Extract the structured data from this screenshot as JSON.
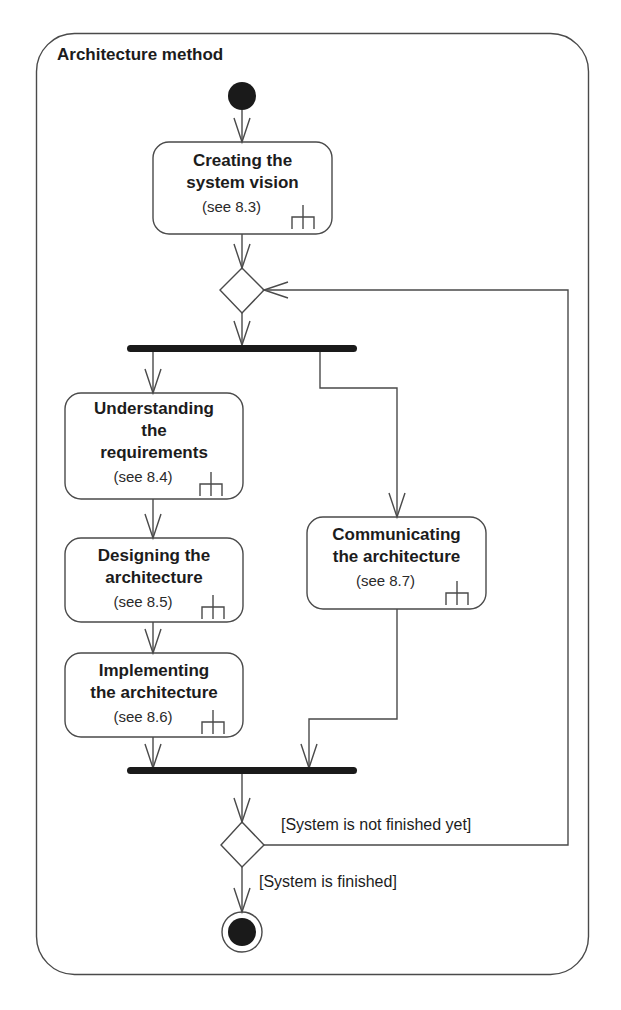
{
  "diagram": {
    "title": "Architecture method",
    "type": "UML activity diagram",
    "colors": {
      "stroke": "#4a4a4a",
      "fill_dark": "#1a1a1a",
      "text": "#1c1c1c",
      "background": "#ffffff"
    },
    "actions": [
      {
        "id": "a1",
        "name": "Creating the system vision",
        "lines": [
          "Creating the",
          "system vision"
        ],
        "ref": "(see 8.3)",
        "icon": "rake-icon"
      },
      {
        "id": "a2",
        "name": "Understanding the requirements",
        "lines": [
          "Understanding",
          "the",
          "requirements"
        ],
        "ref": "(see 8.4)",
        "icon": "rake-icon"
      },
      {
        "id": "a3",
        "name": "Designing the architecture",
        "lines": [
          "Designing the",
          "architecture"
        ],
        "ref": "(see 8.5)",
        "icon": "rake-icon"
      },
      {
        "id": "a4",
        "name": "Implementing the architecture",
        "lines": [
          "Implementing",
          "the architecture"
        ],
        "ref": "(see 8.6)",
        "icon": "rake-icon"
      },
      {
        "id": "a5",
        "name": "Communicating the architecture",
        "lines": [
          "Communicating",
          "the architecture"
        ],
        "ref": "(see 8.7)",
        "icon": "rake-icon"
      }
    ],
    "guards": {
      "not_finished": "[System is not finished yet]",
      "finished": "[System is finished]"
    },
    "nodes": [
      "initial-node",
      "merge-node",
      "fork-bar",
      "join-bar",
      "decision-node",
      "final-node"
    ]
  }
}
